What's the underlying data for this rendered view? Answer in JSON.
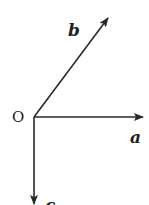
{
  "diagram": {
    "type": "vector-diagram",
    "origin": {
      "label": "O",
      "x": 34,
      "y": 117
    },
    "vectors": [
      {
        "name": "a",
        "label": "a",
        "from": [
          34,
          117
        ],
        "to": [
          143,
          117
        ],
        "label_pos": [
          133,
          143
        ]
      },
      {
        "name": "b",
        "label": "b",
        "from": [
          34,
          117
        ],
        "to": [
          108,
          18
        ],
        "label_pos": [
          68,
          36
        ]
      },
      {
        "name": "c",
        "label": "c",
        "from": [
          34,
          117
        ],
        "to": [
          34,
          205
        ],
        "label_pos": [
          45,
          212
        ]
      }
    ],
    "colors": {
      "stroke": "#2a2a2a",
      "text": "#222222",
      "background": "#ffffff"
    }
  }
}
